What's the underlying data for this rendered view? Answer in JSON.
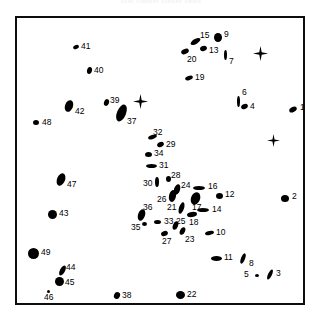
{
  "header": {
    "title": "Star cluster finder chart"
  },
  "figure": {
    "frame": {
      "x": 15,
      "y": 16,
      "width": 290,
      "height": 289,
      "border_color": "#0d0d0d",
      "border_width": 2.5
    },
    "background": "#ffffff",
    "marker_color": "#000000",
    "label_color": "#000000"
  },
  "chart_data": {
    "type": "scatter",
    "title": "Star cluster finder chart",
    "xlabel": "",
    "ylabel": "",
    "xlim": [
      0,
      290
    ],
    "ylim": [
      0,
      289
    ],
    "grid": false,
    "legend": "none",
    "points": [
      {
        "id": "1",
        "x": 276,
        "y": 91,
        "w": 8,
        "h": 5,
        "angle": -28,
        "label_dx": 7,
        "label_dy": -6
      },
      {
        "id": "2",
        "x": 268,
        "y": 180,
        "w": 8,
        "h": 7,
        "angle": 0,
        "label_dx": 7,
        "label_dy": -6
      },
      {
        "id": "3",
        "x": 253,
        "y": 256,
        "w": 4,
        "h": 11,
        "angle": 25,
        "label_dx": 6,
        "label_dy": -5
      },
      {
        "id": "4",
        "x": 227,
        "y": 88,
        "w": 7,
        "h": 5,
        "angle": -25,
        "label_dx": 6,
        "label_dy": 0
      },
      {
        "id": "5",
        "x": 240,
        "y": 257,
        "w": 4,
        "h": 3,
        "angle": 0,
        "label_dx": -13,
        "label_dy": -5
      },
      {
        "id": "6",
        "x": 221,
        "y": 83,
        "w": 3,
        "h": 11,
        "angle": 0,
        "label_dx": 4,
        "label_dy": -13
      },
      {
        "id": "7",
        "x": 208,
        "y": 37,
        "w": 3,
        "h": 10,
        "angle": 0,
        "label_dx": 4,
        "label_dy": 2
      },
      {
        "id": "8",
        "x": 226,
        "y": 240,
        "w": 4,
        "h": 11,
        "angle": 22,
        "label_dx": 6,
        "label_dy": 1
      },
      {
        "id": "9",
        "x": 201,
        "y": 19,
        "w": 8,
        "h": 9,
        "angle": 0,
        "label_dx": 6,
        "label_dy": -7
      },
      {
        "id": "10",
        "x": 192,
        "y": 215,
        "w": 9,
        "h": 4,
        "angle": -12,
        "label_dx": 7,
        "label_dy": -5
      },
      {
        "id": "11",
        "x": 199,
        "y": 240,
        "w": 11,
        "h": 5,
        "angle": 0,
        "label_dx": 8,
        "label_dy": -5
      },
      {
        "id": "12",
        "x": 202,
        "y": 178,
        "w": 7,
        "h": 6,
        "angle": 0,
        "label_dx": 6,
        "label_dy": -6
      },
      {
        "id": "13",
        "x": 186,
        "y": 30,
        "w": 7,
        "h": 5,
        "angle": -15,
        "label_dx": 6,
        "label_dy": -2
      },
      {
        "id": "14",
        "x": 186,
        "y": 192,
        "w": 12,
        "h": 4,
        "angle": 0,
        "label_dx": 9,
        "label_dy": -5
      },
      {
        "id": "15",
        "x": 178,
        "y": 23,
        "w": 11,
        "h": 5,
        "angle": -30,
        "label_dx": 5,
        "label_dy": -10
      },
      {
        "id": "16",
        "x": 182,
        "y": 170,
        "w": 12,
        "h": 4,
        "angle": 0,
        "label_dx": 9,
        "label_dy": -6
      },
      {
        "id": "17",
        "x": 178,
        "y": 180,
        "w": 9,
        "h": 13,
        "angle": 22,
        "label_dx": -3,
        "label_dy": 5
      },
      {
        "id": "18",
        "x": 175,
        "y": 196,
        "w": 10,
        "h": 5,
        "angle": -8,
        "label_dx": -3,
        "label_dy": 4
      },
      {
        "id": "19",
        "x": 172,
        "y": 60,
        "w": 8,
        "h": 4,
        "angle": -20,
        "label_dx": 6,
        "label_dy": -5
      },
      {
        "id": "20",
        "x": 168,
        "y": 33,
        "w": 8,
        "h": 5,
        "angle": -22,
        "label_dx": 2,
        "label_dy": 4
      },
      {
        "id": "21",
        "x": 164,
        "y": 190,
        "w": 5,
        "h": 12,
        "angle": 18,
        "label_dx": -14,
        "label_dy": -5
      },
      {
        "id": "22",
        "x": 163,
        "y": 277,
        "w": 9,
        "h": 8,
        "angle": 0,
        "label_dx": 7,
        "label_dy": -5
      },
      {
        "id": "23",
        "x": 165,
        "y": 213,
        "w": 5,
        "h": 8,
        "angle": 25,
        "label_dx": 3,
        "label_dy": 4
      },
      {
        "id": "24",
        "x": 160,
        "y": 171,
        "w": 6,
        "h": 11,
        "angle": 18,
        "label_dx": 4,
        "label_dy": -8
      },
      {
        "id": "25",
        "x": 158,
        "y": 207,
        "w": 5,
        "h": 9,
        "angle": 22,
        "label_dx": 1,
        "label_dy": -8
      },
      {
        "id": "26",
        "x": 155,
        "y": 178,
        "w": 7,
        "h": 12,
        "angle": 12,
        "label_dx": -15,
        "label_dy": -1
      },
      {
        "id": "27",
        "x": 147,
        "y": 215,
        "w": 7,
        "h": 5,
        "angle": -20,
        "label_dx": -2,
        "label_dy": 4
      },
      {
        "id": "28",
        "x": 151,
        "y": 161,
        "w": 5,
        "h": 6,
        "angle": 0,
        "label_dx": 3,
        "label_dy": -8
      },
      {
        "id": "29",
        "x": 143,
        "y": 126,
        "w": 7,
        "h": 5,
        "angle": -25,
        "label_dx": 6,
        "label_dy": 0
      },
      {
        "id": "30",
        "x": 140,
        "y": 164,
        "w": 4,
        "h": 10,
        "angle": 0,
        "label_dx": -14,
        "label_dy": -3
      },
      {
        "id": "31",
        "x": 134,
        "y": 148,
        "w": 11,
        "h": 4,
        "angle": 0,
        "label_dx": 8,
        "label_dy": -5
      },
      {
        "id": "32",
        "x": 135,
        "y": 119,
        "w": 9,
        "h": 4,
        "angle": -18,
        "label_dx": 1,
        "label_dy": -9
      },
      {
        "id": "33",
        "x": 140,
        "y": 204,
        "w": 7,
        "h": 4,
        "angle": 0,
        "label_dx": 7,
        "label_dy": -5
      },
      {
        "id": "34",
        "x": 131,
        "y": 136,
        "w": 7,
        "h": 5,
        "angle": 0,
        "label_dx": 6,
        "label_dy": -5
      },
      {
        "id": "35",
        "x": 127,
        "y": 206,
        "w": 5,
        "h": 4,
        "angle": 0,
        "label_dx": -13,
        "label_dy": -1
      },
      {
        "id": "36",
        "x": 124,
        "y": 197,
        "w": 7,
        "h": 12,
        "angle": 18,
        "label_dx": 2,
        "label_dy": -12
      },
      {
        "id": "37",
        "x": 104,
        "y": 95,
        "w": 9,
        "h": 18,
        "angle": 22,
        "label_dx": 6,
        "label_dy": 4
      },
      {
        "id": "38",
        "x": 100,
        "y": 277,
        "w": 6,
        "h": 7,
        "angle": 25,
        "label_dx": 5,
        "label_dy": -4
      },
      {
        "id": "39",
        "x": 89,
        "y": 84,
        "w": 5,
        "h": 7,
        "angle": 18,
        "label_dx": 4,
        "label_dy": -6
      },
      {
        "id": "40",
        "x": 72,
        "y": 52,
        "w": 5,
        "h": 7,
        "angle": 12,
        "label_dx": 5,
        "label_dy": -4
      },
      {
        "id": "41",
        "x": 59,
        "y": 29,
        "w": 6,
        "h": 4,
        "angle": -25,
        "label_dx": 5,
        "label_dy": -5
      },
      {
        "id": "42",
        "x": 52,
        "y": 88,
        "w": 8,
        "h": 12,
        "angle": 20,
        "label_dx": 6,
        "label_dy": 1
      },
      {
        "id": "43",
        "x": 35,
        "y": 196,
        "w": 9,
        "h": 9,
        "angle": 0,
        "label_dx": 7,
        "label_dy": -5
      },
      {
        "id": "44",
        "x": 45,
        "y": 252,
        "w": 5,
        "h": 11,
        "angle": 28,
        "label_dx": 4,
        "label_dy": -7
      },
      {
        "id": "45",
        "x": 42,
        "y": 263,
        "w": 9,
        "h": 9,
        "angle": 0,
        "label_dx": 6,
        "label_dy": -3
      },
      {
        "id": "46",
        "x": 31,
        "y": 273,
        "w": 3,
        "h": 3,
        "angle": 0,
        "label_dx": -4,
        "label_dy": 2
      },
      {
        "id": "47",
        "x": 44,
        "y": 161,
        "w": 8,
        "h": 13,
        "angle": 22,
        "label_dx": 6,
        "label_dy": 1
      },
      {
        "id": "48",
        "x": 19,
        "y": 104,
        "w": 6,
        "h": 5,
        "angle": 0,
        "label_dx": 6,
        "label_dy": -4
      },
      {
        "id": "49",
        "x": 16,
        "y": 235,
        "w": 11,
        "h": 11,
        "angle": 0,
        "label_dx": 8,
        "label_dy": -5
      }
    ],
    "star_markers": [
      {
        "x": 123,
        "y": 83,
        "size": 15
      },
      {
        "x": 243,
        "y": 35,
        "size": 15
      },
      {
        "x": 256,
        "y": 122,
        "size": 13
      }
    ]
  }
}
